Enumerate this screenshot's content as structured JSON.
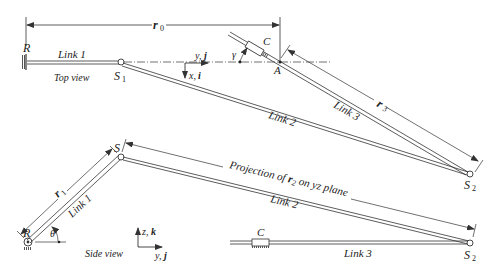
{
  "diagram": {
    "top_view": {
      "title": "Top view",
      "labels": {
        "R": "R",
        "link1": "Link 1",
        "link2": "Link 2",
        "link3": "Link 3",
        "S1": "S",
        "S1_sub": "1",
        "S2": "S",
        "S2_sub": "2",
        "A": "A",
        "C": "C",
        "gamma": "γ",
        "r0": "r",
        "r0_sub": "0",
        "r3": "r",
        "r3_sub": "3",
        "axis_y": "y, ",
        "axis_y_unit": "j",
        "axis_x": "x, ",
        "axis_x_unit": "i"
      }
    },
    "side_view": {
      "title": "Side view",
      "labels": {
        "R": "R",
        "link1": "Link 1",
        "link2": "Link 2",
        "link3": "Link 3",
        "S": "S",
        "S2": "S",
        "S2_sub": "2",
        "C": "C",
        "theta": "θ",
        "r1": "r",
        "r1_sub": "1",
        "projection_pre": "Projection of ",
        "projection_r": "r",
        "projection_sub": "2",
        "projection_post": " on yz plane",
        "axis_z": "z, ",
        "axis_z_unit": "k",
        "axis_y": "y, ",
        "axis_y_unit": "j"
      }
    },
    "colors": {
      "line": "#333333",
      "background": "#ffffff"
    }
  }
}
